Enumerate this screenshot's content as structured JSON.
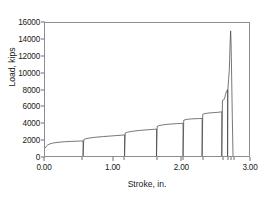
{
  "chart_data": {
    "type": "line",
    "title": "",
    "xlabel": "Stroke, in.",
    "ylabel": "Load, kips",
    "xlim": [
      0.0,
      3.0
    ],
    "ylim": [
      0,
      16000
    ],
    "xticks": [
      "0.00",
      "1.00",
      "2.00",
      "3.00"
    ],
    "xtick_values": [
      0.0,
      1.0,
      2.0,
      3.0
    ],
    "yticks": [
      "0",
      "2000",
      "4000",
      "6000",
      "8000",
      "10000",
      "12000",
      "14000",
      "16000"
    ],
    "ytick_values": [
      0,
      2000,
      4000,
      6000,
      8000,
      10000,
      12000,
      14000,
      16000
    ],
    "grid": false,
    "legend": null,
    "line_color": "#3a3a3a",
    "frame_color": "#8d8d8d",
    "background": "#ffffff",
    "series": [
      {
        "name": "Load vs Stroke",
        "points": [
          [
            0.0,
            950
          ],
          [
            0.02,
            1180
          ],
          [
            0.04,
            1330
          ],
          [
            0.07,
            1450
          ],
          [
            0.11,
            1545
          ],
          [
            0.16,
            1615
          ],
          [
            0.22,
            1670
          ],
          [
            0.29,
            1715
          ],
          [
            0.37,
            1750
          ],
          [
            0.45,
            1778
          ],
          [
            0.52,
            1800
          ],
          [
            0.56,
            1812
          ],
          [
            0.56,
            0
          ],
          [
            0.57,
            1980
          ],
          [
            0.6,
            2075
          ],
          [
            0.65,
            2155
          ],
          [
            0.71,
            2225
          ],
          [
            0.78,
            2285
          ],
          [
            0.86,
            2340
          ],
          [
            0.95,
            2395
          ],
          [
            1.04,
            2450
          ],
          [
            1.12,
            2500
          ],
          [
            1.17,
            2540
          ],
          [
            1.17,
            0
          ],
          [
            1.18,
            2760
          ],
          [
            1.21,
            2855
          ],
          [
            1.26,
            2940
          ],
          [
            1.32,
            3010
          ],
          [
            1.39,
            3075
          ],
          [
            1.47,
            3130
          ],
          [
            1.55,
            3180
          ],
          [
            1.61,
            3215
          ],
          [
            1.64,
            3240
          ],
          [
            1.64,
            0
          ],
          [
            1.65,
            3560
          ],
          [
            1.68,
            3660
          ],
          [
            1.73,
            3740
          ],
          [
            1.79,
            3800
          ],
          [
            1.86,
            3850
          ],
          [
            1.93,
            3888
          ],
          [
            1.99,
            3915
          ],
          [
            2.03,
            3935
          ],
          [
            2.03,
            0
          ],
          [
            2.04,
            4300
          ],
          [
            2.07,
            4380
          ],
          [
            2.11,
            4430
          ],
          [
            2.16,
            4465
          ],
          [
            2.22,
            4490
          ],
          [
            2.27,
            4505
          ],
          [
            2.31,
            4515
          ],
          [
            2.31,
            0
          ],
          [
            2.32,
            5020
          ],
          [
            2.35,
            5100
          ],
          [
            2.39,
            5155
          ],
          [
            2.44,
            5195
          ],
          [
            2.49,
            5225
          ],
          [
            2.54,
            5250
          ],
          [
            2.58,
            5290
          ],
          [
            2.6,
            5330
          ],
          [
            2.6,
            0
          ],
          [
            2.61,
            6700
          ],
          [
            2.63,
            6760
          ],
          [
            2.645,
            7050
          ],
          [
            2.655,
            7400
          ],
          [
            2.665,
            7700
          ],
          [
            2.675,
            7900
          ],
          [
            2.685,
            7970
          ],
          [
            2.685,
            0
          ],
          [
            2.69,
            8050
          ],
          [
            2.7,
            9200
          ],
          [
            2.71,
            10250
          ],
          [
            2.715,
            11500
          ],
          [
            2.72,
            13000
          ],
          [
            2.725,
            14200
          ],
          [
            2.73,
            15050
          ],
          [
            2.735,
            14000
          ],
          [
            2.74,
            12000
          ],
          [
            2.745,
            9500
          ],
          [
            2.75,
            7000
          ],
          [
            2.755,
            4500
          ],
          [
            2.76,
            2200
          ],
          [
            2.765,
            0
          ]
        ]
      }
    ]
  }
}
